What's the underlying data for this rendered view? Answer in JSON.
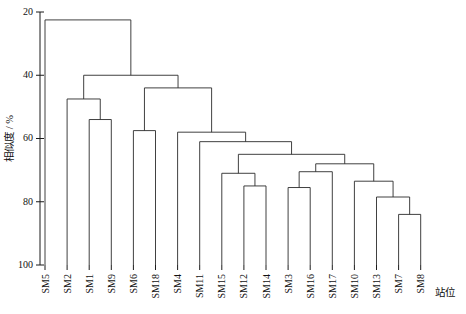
{
  "chart_data": {
    "type": "dendrogram",
    "title": "",
    "xlabel": "站位",
    "ylabel": "相似度 / %",
    "ylim": [
      20,
      100
    ],
    "y_inverted": true,
    "yticks": [
      20,
      40,
      60,
      80,
      100
    ],
    "ytick_labels": [
      "20",
      "40",
      "60",
      "80",
      "100"
    ],
    "grid": false,
    "legend": null,
    "leaf_labels": [
      "SM5",
      "SM2",
      "SM1",
      "SM9",
      "SM6",
      "SM18",
      "SM4",
      "SM11",
      "SM15",
      "SM12",
      "SM14",
      "SM3",
      "SM16",
      "SM17",
      "SM10",
      "SM13",
      "SM7",
      "SM8"
    ],
    "leaf_count": 18,
    "merges": [
      {
        "id": "n1",
        "left": "SM1",
        "right": "SM9",
        "similarity": 54.0
      },
      {
        "id": "n2",
        "left": "SM2",
        "right": "n1",
        "similarity": 47.5
      },
      {
        "id": "n3",
        "left": "SM7",
        "right": "SM8",
        "similarity": 84.0
      },
      {
        "id": "n4",
        "left": "SM13",
        "right": "n3",
        "similarity": 78.5
      },
      {
        "id": "n5",
        "left": "SM10",
        "right": "n4",
        "similarity": 73.5
      },
      {
        "id": "n6",
        "left": "SM12",
        "right": "SM14",
        "similarity": 75.0
      },
      {
        "id": "n7",
        "left": "SM15",
        "right": "n6",
        "similarity": 71.0
      },
      {
        "id": "n8",
        "left": "SM3",
        "right": "SM16",
        "similarity": 75.5
      },
      {
        "id": "n9",
        "left": "n8",
        "right": "SM17",
        "similarity": 70.5
      },
      {
        "id": "n10",
        "left": "n9",
        "right": "n5",
        "similarity": 68.0
      },
      {
        "id": "n11",
        "left": "n7",
        "right": "n10",
        "similarity": 65.0
      },
      {
        "id": "n12",
        "left": "SM11",
        "right": "n11",
        "similarity": 61.0
      },
      {
        "id": "n13",
        "left": "SM4",
        "right": "n12",
        "similarity": 58.0
      },
      {
        "id": "n14",
        "left": "SM6",
        "right": "SM18",
        "similarity": 57.5
      },
      {
        "id": "n15",
        "left": "n14",
        "right": "n13",
        "similarity": 44.0
      },
      {
        "id": "n16",
        "left": "n2",
        "right": "n15",
        "similarity": 40.0
      },
      {
        "id": "n17",
        "left": "SM5",
        "right": "n16",
        "similarity": 22.5
      }
    ]
  }
}
